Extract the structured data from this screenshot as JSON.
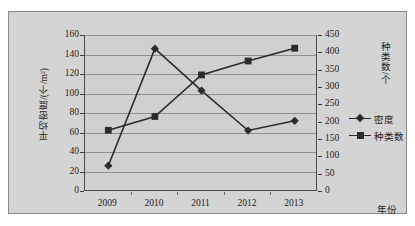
{
  "top_remnant": "┄",
  "chart_data": {
    "type": "line",
    "title": "",
    "xlabel": "年份",
    "categories": [
      "2009",
      "2010",
      "2011",
      "2012",
      "2013"
    ],
    "grid": true,
    "legend_position": "right",
    "axes": {
      "left": {
        "label": "平均密度/(个/m²)",
        "min": 0,
        "max": 160,
        "step": 20,
        "ticks": [
          "0",
          "20",
          "40",
          "60",
          "80",
          "100",
          "120",
          "140",
          "160"
        ]
      },
      "right": {
        "label": "种类数/个",
        "min": 0,
        "max": 450,
        "step": 50,
        "ticks": [
          "0",
          "50",
          "100",
          "150",
          "200",
          "250",
          "300",
          "350",
          "400",
          "450"
        ]
      },
      "x": {
        "label": "年份",
        "ticks": [
          "2009",
          "2010",
          "2011",
          "2012",
          "2013"
        ]
      }
    },
    "series": [
      {
        "name": "密度",
        "axis": "left",
        "marker": "diamond",
        "color": "#2b2b2b",
        "values": [
          26,
          146,
          103,
          62,
          72
        ]
      },
      {
        "name": "种类数",
        "axis": "right",
        "marker": "square",
        "color": "#2b2b2b",
        "values": [
          175,
          215,
          335,
          375,
          412
        ]
      }
    ],
    "legend": [
      {
        "label": "密度",
        "marker": "diamond"
      },
      {
        "label": "种类数",
        "marker": "square"
      }
    ]
  }
}
